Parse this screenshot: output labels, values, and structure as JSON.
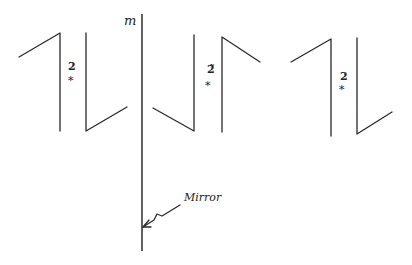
{
  "diagram": {
    "type": "mirror-symmetry-illustration",
    "mirror": {
      "symbol_label": "m",
      "callout_label": "Mirror"
    },
    "motifs": [
      {
        "id": "motif-1",
        "label_number": "2",
        "label_mark": "*",
        "orientation": "original"
      },
      {
        "id": "motif-2",
        "label_number": "2̃",
        "label_mark": "*",
        "orientation": "mirror-image"
      },
      {
        "id": "motif-3",
        "label_number": "2",
        "label_mark": "*",
        "orientation": "translated-copy"
      }
    ],
    "stroke_color": "#2a2a2a",
    "background_color": "#ffffff"
  }
}
